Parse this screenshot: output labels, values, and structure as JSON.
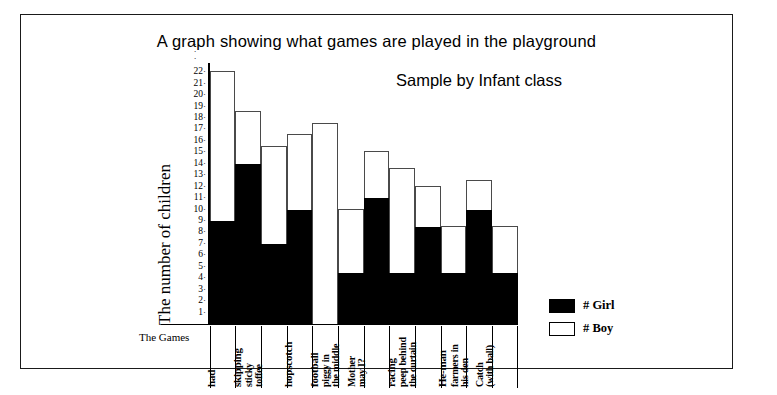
{
  "title": "A graph showing what games are played in the playground",
  "subtitle": "Sample by Infant class",
  "axis": {
    "y_label": "The number of children",
    "x_label": "The Games"
  },
  "legend": {
    "items": [
      {
        "label": "# Girl",
        "color": "#000000",
        "key": "girl"
      },
      {
        "label": "# Boy",
        "color": "#ffffff",
        "key": "boy"
      }
    ]
  },
  "chart_data": {
    "type": "bar",
    "stacked": true,
    "title": "A graph showing what games are played in the playground",
    "subtitle": "Sample by Infant class",
    "xlabel": "The Games",
    "ylabel": "The number of children",
    "ylim": [
      0,
      22
    ],
    "yticks": [
      1,
      2,
      3,
      4,
      5,
      6,
      7,
      8,
      9,
      10,
      11,
      12,
      13,
      14,
      15,
      16,
      17,
      18,
      19,
      20,
      21,
      22
    ],
    "grid": false,
    "legend_position": "right-bottom",
    "categories": [
      "had",
      "skipping",
      "sticky toffee",
      "hopscotch",
      "football",
      "piggy in the middle",
      "Mother may I?",
      "racing",
      "peep behind the curtain",
      "He-man",
      "farmers in his den",
      "Catch (with ball)"
    ],
    "series": [
      {
        "name": "# Girl",
        "color": "#000000",
        "values": [
          9,
          14,
          7,
          10,
          0,
          4.5,
          11,
          4.5,
          8.5,
          4.5,
          10,
          4.5
        ]
      },
      {
        "name": "# Boy",
        "color": "#ffffff",
        "values": [
          13,
          4.5,
          8.5,
          6.5,
          17.5,
          5.5,
          4,
          9,
          3.5,
          4,
          2.5,
          4
        ]
      }
    ],
    "totals": [
      22,
      18.5,
      15.5,
      16.5,
      17.5,
      10,
      15,
      13.5,
      12,
      8.5,
      12.5,
      8.5
    ]
  },
  "category_label_lines": [
    [
      "had"
    ],
    [
      "skipping"
    ],
    [
      "sticky",
      "toffee"
    ],
    [
      "hopscotch"
    ],
    [
      "football"
    ],
    [
      "piggy in",
      "the middle"
    ],
    [
      "Mother",
      "may I?"
    ],
    [
      "racing"
    ],
    [
      "peep behind",
      "the curtain"
    ],
    [
      "He-man"
    ],
    [
      "farmers in",
      "his den"
    ],
    [
      "Catch",
      "(with ball)"
    ]
  ]
}
